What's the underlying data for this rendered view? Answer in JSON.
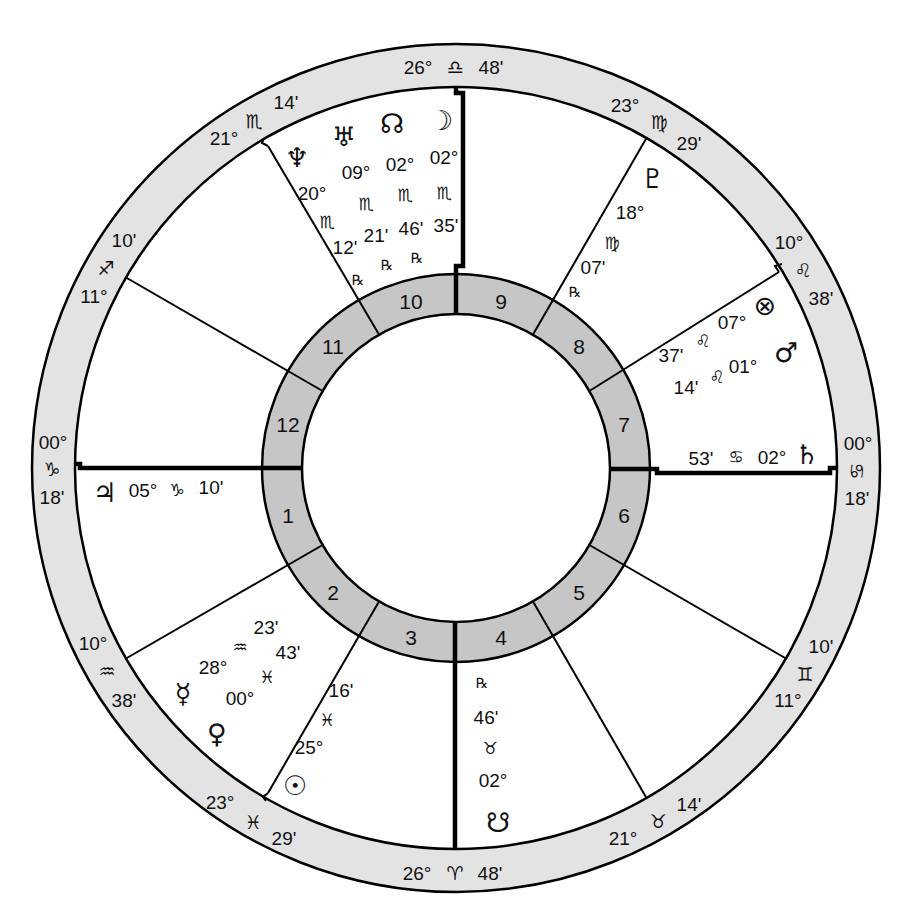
{
  "wheel": {
    "colors": {
      "zodiac_ring": "#e3e3e3",
      "house_ring": "#c6c6c6",
      "line": "#000000",
      "background": "#ffffff"
    },
    "house_numbers": [
      "1",
      "2",
      "3",
      "4",
      "5",
      "6",
      "7",
      "8",
      "9",
      "10",
      "11",
      "12"
    ],
    "cusps": [
      {
        "degree": "00°",
        "sign": "♑",
        "sign_name": "capricorn",
        "minutes": "18'"
      },
      {
        "degree": "10°",
        "sign": "♒",
        "sign_name": "aquarius",
        "minutes": "38'"
      },
      {
        "degree": "23°",
        "sign": "♓",
        "sign_name": "pisces",
        "minutes": "29'"
      },
      {
        "degree": "26°",
        "sign": "♈",
        "sign_name": "aries",
        "minutes": "48'"
      },
      {
        "degree": "21°",
        "sign": "♉",
        "sign_name": "taurus",
        "minutes": "14'"
      },
      {
        "degree": "11°",
        "sign": "♊",
        "sign_name": "gemini",
        "minutes": "10'"
      },
      {
        "degree": "00°",
        "sign": "♋",
        "sign_name": "cancer",
        "minutes": "18'"
      },
      {
        "degree": "10°",
        "sign": "♌",
        "sign_name": "leo",
        "minutes": "38'"
      },
      {
        "degree": "23°",
        "sign": "♍",
        "sign_name": "virgo",
        "minutes": "29'"
      },
      {
        "degree": "26°",
        "sign": "♎",
        "sign_name": "libra",
        "minutes": "48'"
      },
      {
        "degree": "21°",
        "sign": "♏",
        "sign_name": "scorpio",
        "minutes": "14'"
      },
      {
        "degree": "11°",
        "sign": "♐",
        "sign_name": "sagittarius",
        "minutes": "10'"
      }
    ],
    "planets": [
      {
        "name": "neptune",
        "glyph": "♆",
        "degree": "20°",
        "sign": "♏",
        "sign_name": "scorpio",
        "minutes": "12'",
        "retrograde": "℞",
        "house": "10"
      },
      {
        "name": "uranus",
        "glyph": "♅",
        "degree": "09°",
        "sign": "♏",
        "sign_name": "scorpio",
        "minutes": "21'",
        "retrograde": "℞",
        "house": "10"
      },
      {
        "name": "north-node",
        "glyph": "☊",
        "degree": "02°",
        "sign": "♏",
        "sign_name": "scorpio",
        "minutes": "46'",
        "retrograde": "℞",
        "house": "10"
      },
      {
        "name": "moon",
        "glyph": "☽",
        "degree": "02°",
        "sign": "♏",
        "sign_name": "scorpio",
        "minutes": "35'",
        "house": "10"
      },
      {
        "name": "pluto",
        "glyph": "♇",
        "degree": "18°",
        "sign": "♍",
        "sign_name": "virgo",
        "minutes": "07'",
        "retrograde": "℞",
        "house": "8"
      },
      {
        "name": "part-of-fortune",
        "glyph": "⊗",
        "degree": "07°",
        "sign": "♌",
        "sign_name": "leo",
        "minutes": "37'",
        "house": "7"
      },
      {
        "name": "mars",
        "glyph": "♂",
        "degree": "01°",
        "sign": "♌",
        "sign_name": "leo",
        "minutes": "14'",
        "house": "7"
      },
      {
        "name": "saturn",
        "glyph": "♄",
        "degree": "02°",
        "sign": "♋",
        "sign_name": "cancer",
        "minutes": "53'",
        "house": "7"
      },
      {
        "name": "jupiter",
        "glyph": "♃",
        "degree": "05°",
        "sign": "♑",
        "sign_name": "capricorn",
        "minutes": "10'",
        "house": "1"
      },
      {
        "name": "mercury",
        "glyph": "☿",
        "degree": "28°",
        "sign": "♒",
        "sign_name": "aquarius",
        "minutes": "23'",
        "house": "2"
      },
      {
        "name": "venus",
        "glyph": "♀",
        "degree": "00°",
        "sign": "♓",
        "sign_name": "pisces",
        "minutes": "43'",
        "house": "2"
      },
      {
        "name": "sun",
        "glyph": "☉",
        "degree": "25°",
        "sign": "♓",
        "sign_name": "pisces",
        "minutes": "16'",
        "house": "3"
      },
      {
        "name": "south-node",
        "glyph": "☋",
        "degree": "02°",
        "sign": "♉",
        "sign_name": "taurus",
        "minutes": "46'",
        "retrograde": "℞",
        "house": "4"
      }
    ]
  }
}
